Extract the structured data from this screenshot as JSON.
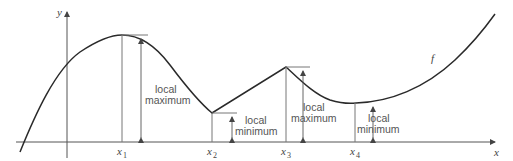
{
  "figure": {
    "axes": {
      "x_label": "x",
      "y_label": "y"
    },
    "function_label": "f",
    "points": [
      {
        "name": "x",
        "sub": "1",
        "type": "local maximum"
      },
      {
        "name": "x",
        "sub": "2",
        "type": "local minimum"
      },
      {
        "name": "x",
        "sub": "3",
        "type": "local maximum"
      },
      {
        "name": "x",
        "sub": "4",
        "type": "local minimum"
      }
    ],
    "annotations": [
      {
        "line1": "local",
        "line2": "maximum"
      },
      {
        "line1": "local",
        "line2": "minimum"
      },
      {
        "line1": "local",
        "line2": "maximum"
      },
      {
        "line1": "local",
        "line2": "minimum"
      }
    ]
  },
  "colors": {
    "curve": "#2a2a2a",
    "axis": "#555555",
    "guide": "#777777"
  }
}
